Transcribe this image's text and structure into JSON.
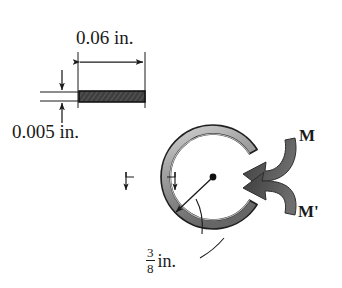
{
  "figure": {
    "background_color": "#ffffff",
    "line_color": "#1a1a1a",
    "ring_fill_light": "#e8e8e8",
    "ring_fill_mid": "#9a9a9a",
    "ring_fill_dark": "#555555",
    "bar_fill_dark": "#3a3a3a",
    "moment_arrow_color": "#4a4a4a"
  },
  "cross_section": {
    "width_label": "0.06 in.",
    "thickness_label": "0.005 in.",
    "bar_name": "rectangular-bar-cross-section"
  },
  "ring": {
    "radius_value": "3",
    "radius_denominator": "8",
    "radius_unit": "in.",
    "center_name": "ring-center-point",
    "gap_name": "ring-gap"
  },
  "moments": {
    "upper_label": "M",
    "lower_label": "M'"
  }
}
